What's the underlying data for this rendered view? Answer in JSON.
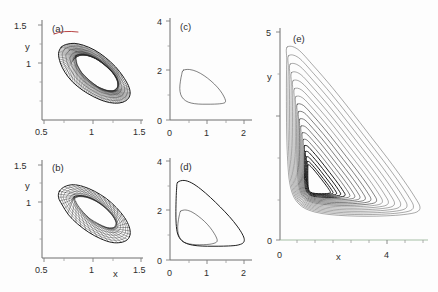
{
  "figure": {
    "name": "phase-portrait-panel-figure",
    "background": "#fdfdfd",
    "width": 438,
    "height": 292
  },
  "chart_data": [
    {
      "type": "line",
      "panel": "a",
      "label": "(a)",
      "title": "",
      "xlabel": "",
      "ylabel": "y",
      "xlim": [
        0.45,
        1.55
      ],
      "ylim": [
        0.55,
        1.62
      ],
      "xticks": [
        0.5,
        1,
        1.5
      ],
      "xticklabels": [
        "0.5",
        "1",
        "1.5"
      ],
      "yticks": [
        1,
        1.5
      ],
      "yticklabels": [
        "1",
        "1.5"
      ],
      "grid": false,
      "legend": "none",
      "description": "quasiperiodic torus: dense banded elliptical annulus tilted down to the right",
      "series": [
        {
          "name": "torus-outer-envelope",
          "closed": true,
          "points": [
            [
              0.66,
              1.33
            ],
            [
              0.72,
              1.36
            ],
            [
              0.8,
              1.37
            ],
            [
              0.9,
              1.35
            ],
            [
              1.02,
              1.3
            ],
            [
              1.14,
              1.22
            ],
            [
              1.25,
              1.12
            ],
            [
              1.33,
              1.02
            ],
            [
              1.39,
              0.92
            ],
            [
              1.41,
              0.84
            ],
            [
              1.39,
              0.78
            ],
            [
              1.33,
              0.74
            ],
            [
              1.24,
              0.73
            ],
            [
              1.13,
              0.75
            ],
            [
              1.01,
              0.8
            ],
            [
              0.89,
              0.87
            ],
            [
              0.78,
              0.96
            ],
            [
              0.7,
              1.06
            ],
            [
              0.65,
              1.16
            ],
            [
              0.63,
              1.26
            ]
          ]
        },
        {
          "name": "torus-inner-envelope",
          "closed": true,
          "points": [
            [
              0.82,
              1.24
            ],
            [
              0.9,
              1.25
            ],
            [
              0.99,
              1.23
            ],
            [
              1.09,
              1.18
            ],
            [
              1.18,
              1.1
            ],
            [
              1.25,
              1.02
            ],
            [
              1.28,
              0.95
            ],
            [
              1.27,
              0.89
            ],
            [
              1.22,
              0.86
            ],
            [
              1.14,
              0.87
            ],
            [
              1.05,
              0.91
            ],
            [
              0.96,
              0.98
            ],
            [
              0.88,
              1.06
            ],
            [
              0.83,
              1.15
            ]
          ]
        }
      ],
      "highlight": {
        "name": "red-arc-top",
        "color": "#b03030"
      }
    },
    {
      "type": "line",
      "panel": "b",
      "label": "(b)",
      "title": "",
      "xlabel": "x",
      "ylabel": "y",
      "xlim": [
        0.45,
        1.55
      ],
      "ylim": [
        0.55,
        1.62
      ],
      "xticks": [
        0.5,
        1,
        1.5
      ],
      "xticklabels": [
        "0.5",
        "1",
        "1.5"
      ],
      "yticks": [
        1,
        1.5
      ],
      "yticklabels": [
        "1",
        "1.5"
      ],
      "grid": false,
      "legend": "none",
      "description": "wrinkled torus: elliptical annulus with coarser internal folded bands",
      "series": [
        {
          "name": "torus-outer-envelope",
          "closed": true,
          "points": [
            [
              0.64,
              1.28
            ],
            [
              0.7,
              1.33
            ],
            [
              0.79,
              1.35
            ],
            [
              0.9,
              1.33
            ],
            [
              1.02,
              1.28
            ],
            [
              1.15,
              1.2
            ],
            [
              1.26,
              1.1
            ],
            [
              1.35,
              0.99
            ],
            [
              1.4,
              0.89
            ],
            [
              1.41,
              0.81
            ],
            [
              1.38,
              0.75
            ],
            [
              1.31,
              0.72
            ],
            [
              1.21,
              0.72
            ],
            [
              1.09,
              0.76
            ],
            [
              0.96,
              0.83
            ],
            [
              0.84,
              0.92
            ],
            [
              0.74,
              1.02
            ],
            [
              0.67,
              1.13
            ],
            [
              0.63,
              1.21
            ]
          ]
        },
        {
          "name": "torus-inner-envelope",
          "closed": true,
          "points": [
            [
              0.8,
              1.22
            ],
            [
              0.89,
              1.23
            ],
            [
              0.99,
              1.2
            ],
            [
              1.09,
              1.14
            ],
            [
              1.18,
              1.06
            ],
            [
              1.24,
              0.98
            ],
            [
              1.26,
              0.92
            ],
            [
              1.23,
              0.88
            ],
            [
              1.16,
              0.88
            ],
            [
              1.07,
              0.92
            ],
            [
              0.97,
              0.98
            ],
            [
              0.89,
              1.06
            ],
            [
              0.83,
              1.14
            ]
          ]
        }
      ]
    },
    {
      "type": "line",
      "panel": "c",
      "label": "(c)",
      "title": "",
      "xlabel": "",
      "ylabel": "",
      "xlim": [
        0,
        2.6
      ],
      "ylim": [
        0,
        4
      ],
      "xticks": [
        0,
        1,
        2
      ],
      "xticklabels": [
        "0",
        "1",
        "2"
      ],
      "yticks": [
        0,
        2,
        4
      ],
      "yticklabels": [
        "0",
        "2",
        "4"
      ],
      "grid": false,
      "legend": "none",
      "description": "single closed limit cycle, teardrop shaped with cusp at lower right",
      "series": [
        {
          "name": "limit-cycle",
          "closed": true,
          "points": [
            [
              0.42,
              1.95
            ],
            [
              0.62,
              1.98
            ],
            [
              0.85,
              1.9
            ],
            [
              1.08,
              1.74
            ],
            [
              1.3,
              1.53
            ],
            [
              1.5,
              1.29
            ],
            [
              1.65,
              1.05
            ],
            [
              1.74,
              0.84
            ],
            [
              1.76,
              0.72
            ],
            [
              1.7,
              0.66
            ],
            [
              1.52,
              0.63
            ],
            [
              1.28,
              0.62
            ],
            [
              1.02,
              0.62
            ],
            [
              0.78,
              0.64
            ],
            [
              0.58,
              0.7
            ],
            [
              0.43,
              0.82
            ],
            [
              0.34,
              1.0
            ],
            [
              0.31,
              1.24
            ],
            [
              0.33,
              1.52
            ],
            [
              0.37,
              1.78
            ]
          ]
        }
      ]
    },
    {
      "type": "line",
      "panel": "d",
      "label": "(d)",
      "title": "",
      "xlabel": "",
      "ylabel": "",
      "xlim": [
        0,
        3.2
      ],
      "ylim": [
        0,
        4
      ],
      "xticks": [
        0,
        1,
        2
      ],
      "xticklabels": [
        "0",
        "1",
        "2"
      ],
      "yticks": [
        0,
        2,
        4
      ],
      "yticklabels": [
        "0",
        "2",
        "4"
      ],
      "grid": false,
      "legend": "none",
      "description": "period-two orbit: two nested closed loops sharing a narrow channel near x=2",
      "series": [
        {
          "name": "outer-loop",
          "closed": true,
          "points": [
            [
              0.3,
              3.05
            ],
            [
              0.55,
              3.12
            ],
            [
              0.85,
              3.02
            ],
            [
              1.2,
              2.78
            ],
            [
              1.58,
              2.45
            ],
            [
              1.96,
              2.08
            ],
            [
              2.32,
              1.7
            ],
            [
              2.62,
              1.33
            ],
            [
              2.82,
              1.02
            ],
            [
              2.9,
              0.8
            ],
            [
              2.84,
              0.66
            ],
            [
              2.62,
              0.58
            ],
            [
              2.28,
              0.55
            ],
            [
              1.88,
              0.54
            ],
            [
              1.46,
              0.54
            ],
            [
              1.06,
              0.56
            ],
            [
              0.72,
              0.62
            ],
            [
              0.46,
              0.76
            ],
            [
              0.3,
              1.02
            ],
            [
              0.24,
              1.42
            ],
            [
              0.23,
              1.9
            ],
            [
              0.24,
              2.42
            ],
            [
              0.26,
              2.82
            ]
          ]
        },
        {
          "name": "inner-loop",
          "closed": true,
          "points": [
            [
              0.42,
              1.92
            ],
            [
              0.62,
              1.96
            ],
            [
              0.86,
              1.88
            ],
            [
              1.1,
              1.72
            ],
            [
              1.34,
              1.52
            ],
            [
              1.56,
              1.28
            ],
            [
              1.72,
              1.05
            ],
            [
              1.82,
              0.86
            ],
            [
              1.84,
              0.74
            ],
            [
              1.76,
              0.67
            ],
            [
              1.56,
              0.62
            ],
            [
              1.3,
              0.6
            ],
            [
              1.02,
              0.6
            ],
            [
              0.76,
              0.63
            ],
            [
              0.55,
              0.7
            ],
            [
              0.4,
              0.84
            ],
            [
              0.32,
              1.04
            ],
            [
              0.3,
              1.3
            ],
            [
              0.33,
              1.58
            ],
            [
              0.37,
              1.78
            ]
          ]
        }
      ]
    },
    {
      "type": "line",
      "panel": "e",
      "label": "(e)",
      "title": "",
      "xlabel": "x",
      "ylabel": "y",
      "xlim": [
        0,
        4.6
      ],
      "ylim": [
        0,
        5
      ],
      "xticks": [
        0,
        4
      ],
      "xticklabels": [
        "0",
        "4"
      ],
      "yticks": [
        0,
        5
      ],
      "yticklabels": [
        "0",
        "5"
      ],
      "grid": false,
      "legend": "none",
      "description": "chaotic attractor: many nested triangular trajectory loops spiraling outward from an inner focus near (1.0,1.2)",
      "loop_count": 18,
      "inner_focus": [
        1.0,
        1.2
      ],
      "series": [
        {
          "name": "chaotic-trajectory-loops",
          "scale_min": 0.17,
          "scale_max": 1.0
        }
      ]
    }
  ]
}
